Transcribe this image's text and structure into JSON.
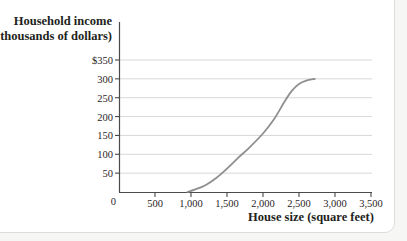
{
  "page": {
    "background": "#f6f6f4",
    "card_background": "#ffffff",
    "card_border": "#dcdcdc"
  },
  "chart_data": {
    "type": "line",
    "title": "",
    "ylabel_line1": "Household income",
    "ylabel_line2": "(thousands of dollars)",
    "xlabel": "House size (square feet)",
    "origin_label": "0",
    "xlim": [
      0,
      3500
    ],
    "ylim": [
      0,
      350
    ],
    "grid": "horizontal-only",
    "legend": "none",
    "y_ticks": [
      {
        "value": 350,
        "label": "$350"
      },
      {
        "value": 300,
        "label": "300"
      },
      {
        "value": 250,
        "label": "250"
      },
      {
        "value": 200,
        "label": "200"
      },
      {
        "value": 150,
        "label": "150"
      },
      {
        "value": 100,
        "label": "100"
      },
      {
        "value": 50,
        "label": "50"
      }
    ],
    "x_ticks": [
      {
        "value": 500,
        "label": "500"
      },
      {
        "value": 1000,
        "label": "1,000"
      },
      {
        "value": 1500,
        "label": "1,500"
      },
      {
        "value": 2000,
        "label": "2,000"
      },
      {
        "value": 2500,
        "label": "2,500"
      },
      {
        "value": 3000,
        "label": "3,000"
      },
      {
        "value": 3500,
        "label": "3,500"
      }
    ],
    "series": [
      {
        "name": "household-income-vs-house-size",
        "color": "#8f8f8f",
        "points": [
          [
            950,
            0
          ],
          [
            1050,
            6
          ],
          [
            1200,
            18
          ],
          [
            1350,
            37
          ],
          [
            1500,
            62
          ],
          [
            1650,
            90
          ],
          [
            1800,
            116
          ],
          [
            2000,
            155
          ],
          [
            2150,
            192
          ],
          [
            2300,
            240
          ],
          [
            2400,
            268
          ],
          [
            2500,
            286
          ],
          [
            2600,
            295
          ],
          [
            2720,
            300
          ]
        ]
      }
    ],
    "colors": {
      "axis": "#4a4a4a",
      "grid": "#d8d8d8",
      "text": "#231f20"
    }
  }
}
